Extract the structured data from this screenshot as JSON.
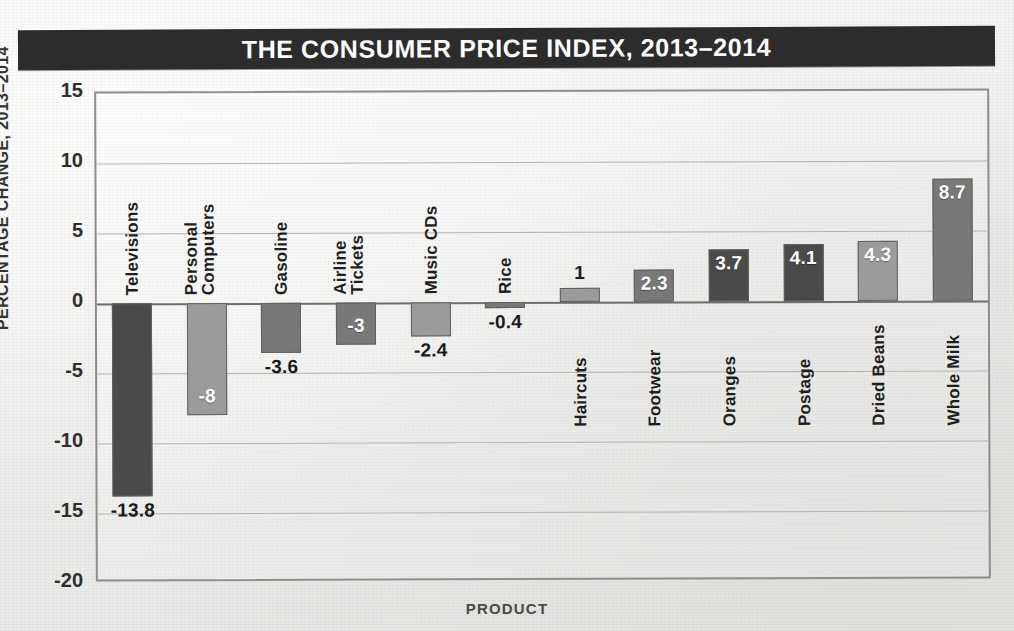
{
  "title": "THE CONSUMER PRICE INDEX, 2013–2014",
  "axis": {
    "ylabel": "PERCENTAGE CHANGE, 2013–2014",
    "xlabel": "PRODUCT",
    "yticks": [
      "15",
      "10",
      "5",
      "0",
      "-5",
      "-10",
      "-15",
      "-20"
    ]
  },
  "colors": {
    "title_bar": "#2c2c2c",
    "title_text": "#fdfdfd",
    "bar_dark": "#4a4a4a",
    "bar_medium": "#787878",
    "bar_light": "#9b9b9b",
    "bar_border": "#5f5f5f",
    "grid": "#b4b4b0",
    "axis": "#8d8d8d",
    "paper": "#f0f0ee"
  },
  "chart_data": {
    "type": "bar",
    "title": "THE CONSUMER PRICE INDEX, 2013–2014",
    "xlabel": "PRODUCT",
    "ylabel": "PERCENTAGE CHANGE, 2013–2014",
    "ylim": [
      -20,
      15
    ],
    "ytick_values": [
      15,
      10,
      5,
      0,
      -5,
      -10,
      -15,
      -20
    ],
    "grid": true,
    "legend": "none",
    "categories": [
      "Televisions",
      "Personal Computers",
      "Gasoline",
      "Airline Tickets",
      "Music CDs",
      "Rice",
      "Haircuts",
      "Footwear",
      "Oranges",
      "Postage",
      "Dried Beans",
      "Whole Milk"
    ],
    "values": [
      -13.8,
      -8,
      -3.6,
      -3,
      -2.4,
      -0.4,
      1,
      2.3,
      3.7,
      4.1,
      4.3,
      8.7
    ],
    "data_labels": [
      "-13.8",
      "-8",
      "-3.6",
      "-3",
      "-2.4",
      "-0.4",
      "1",
      "2.3",
      "3.7",
      "4.1",
      "4.3",
      "8.7"
    ],
    "bars": [
      {
        "category": "Televisions",
        "category_lines": [
          "Televisions"
        ],
        "value": -13.8,
        "label": "-13.8",
        "shade": "dark",
        "label_position": "outside"
      },
      {
        "category": "Personal Computers",
        "category_lines": [
          "Personal",
          "Computers"
        ],
        "value": -8,
        "label": "-8",
        "shade": "light",
        "label_position": "inside"
      },
      {
        "category": "Gasoline",
        "category_lines": [
          "Gasoline"
        ],
        "value": -3.6,
        "label": "-3.6",
        "shade": "medium",
        "label_position": "outside"
      },
      {
        "category": "Airline Tickets",
        "category_lines": [
          "Airline",
          "Tickets"
        ],
        "value": -3,
        "label": "-3",
        "shade": "medium",
        "label_position": "inside"
      },
      {
        "category": "Music CDs",
        "category_lines": [
          "Music CDs"
        ],
        "value": -2.4,
        "label": "-2.4",
        "shade": "light",
        "label_position": "outside"
      },
      {
        "category": "Rice",
        "category_lines": [
          "Rice"
        ],
        "value": -0.4,
        "label": "-0.4",
        "shade": "medium",
        "label_position": "outside"
      },
      {
        "category": "Haircuts",
        "category_lines": [
          "Haircuts"
        ],
        "value": 1,
        "label": "1",
        "shade": "light",
        "label_position": "outside"
      },
      {
        "category": "Footwear",
        "category_lines": [
          "Footwear"
        ],
        "value": 2.3,
        "label": "2.3",
        "shade": "medium",
        "label_position": "inside"
      },
      {
        "category": "Oranges",
        "category_lines": [
          "Oranges"
        ],
        "value": 3.7,
        "label": "3.7",
        "shade": "dark",
        "label_position": "inside"
      },
      {
        "category": "Postage",
        "category_lines": [
          "Postage"
        ],
        "value": 4.1,
        "label": "4.1",
        "shade": "dark",
        "label_position": "inside"
      },
      {
        "category": "Dried Beans",
        "category_lines": [
          "Dried Beans"
        ],
        "value": 4.3,
        "label": "4.3",
        "shade": "light",
        "label_position": "inside"
      },
      {
        "category": "Whole Milk",
        "category_lines": [
          "Whole Milk"
        ],
        "value": 8.7,
        "label": "8.7",
        "shade": "medium",
        "label_position": "inside"
      }
    ]
  }
}
